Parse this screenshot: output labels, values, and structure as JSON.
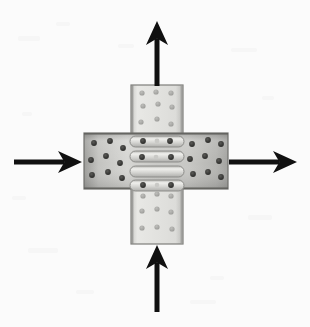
{
  "figure": {
    "title": "Bolted cruciform steel plate splice connection under biaxial loading",
    "background_color": "#fbfbfb",
    "width": 310,
    "height": 327
  },
  "members": {
    "horizontal_plate": {
      "name": "Horizontal splice plate",
      "x": 84,
      "y": 133,
      "width": 144,
      "height": 56,
      "fill_light": "#d8d8d6",
      "fill_mid": "#b9b9b6",
      "fill_dark": "#9d9d9a",
      "edge_color": "#6f6f6c"
    },
    "vertical_plate_top": {
      "name": "Upper vertical splice plate",
      "x": 131,
      "y": 85,
      "width": 52,
      "height": 52,
      "fill_light": "#e6e6e3",
      "fill_mid": "#d5d5d2",
      "edge_color": "#7a7a77"
    },
    "vertical_plate_bottom": {
      "name": "Lower vertical splice plate",
      "x": 131,
      "y": 186,
      "width": 52,
      "height": 58,
      "fill_light": "#e6e6e3",
      "fill_mid": "#d5d5d2",
      "edge_color": "#7a7a77"
    }
  },
  "weld_beads": {
    "name": "Weld bead strips at joint core",
    "count": 4,
    "color_light": "#ededea",
    "color_mid": "#cfcfcc",
    "outline": "#8d8d8a",
    "items": [
      {
        "x": 130,
        "y": 136,
        "width": 54,
        "height": 11,
        "rx": 5
      },
      {
        "x": 130,
        "y": 152,
        "width": 54,
        "height": 11,
        "rx": 5
      },
      {
        "x": 130,
        "y": 166,
        "width": 54,
        "height": 11,
        "rx": 5
      },
      {
        "x": 130,
        "y": 180,
        "width": 54,
        "height": 11,
        "rx": 5
      }
    ]
  },
  "bolt_holes": {
    "dark_color": "#3a3a38",
    "light_color": "#a9a9a6",
    "radius_dark": 2.9,
    "radius_light": 2.6,
    "horizontal_left": [
      {
        "cx": 94,
        "cy": 143
      },
      {
        "cx": 110,
        "cy": 141
      },
      {
        "cx": 123,
        "cy": 148
      },
      {
        "cx": 91,
        "cy": 160
      },
      {
        "cx": 106,
        "cy": 156
      },
      {
        "cx": 120,
        "cy": 163
      },
      {
        "cx": 92,
        "cy": 175
      },
      {
        "cx": 108,
        "cy": 172
      },
      {
        "cx": 122,
        "cy": 178
      }
    ],
    "horizontal_right": [
      {
        "cx": 192,
        "cy": 144
      },
      {
        "cx": 208,
        "cy": 140
      },
      {
        "cx": 221,
        "cy": 144
      },
      {
        "cx": 190,
        "cy": 159
      },
      {
        "cx": 205,
        "cy": 156
      },
      {
        "cx": 219,
        "cy": 161
      },
      {
        "cx": 193,
        "cy": 174
      },
      {
        "cx": 208,
        "cy": 172
      },
      {
        "cx": 221,
        "cy": 177
      }
    ],
    "weld_bolts": [
      {
        "cx": 143,
        "cy": 141
      },
      {
        "cx": 157,
        "cy": 141
      },
      {
        "cx": 170,
        "cy": 141
      },
      {
        "cx": 142,
        "cy": 158
      },
      {
        "cx": 156,
        "cy": 158
      },
      {
        "cx": 171,
        "cy": 158
      },
      {
        "cx": 143,
        "cy": 185
      },
      {
        "cx": 157,
        "cy": 184
      },
      {
        "cx": 171,
        "cy": 185
      }
    ],
    "vertical_top": [
      {
        "cx": 142,
        "cy": 93
      },
      {
        "cx": 156,
        "cy": 92
      },
      {
        "cx": 171,
        "cy": 93
      },
      {
        "cx": 143,
        "cy": 106
      },
      {
        "cx": 158,
        "cy": 104
      },
      {
        "cx": 172,
        "cy": 107
      },
      {
        "cx": 141,
        "cy": 122
      },
      {
        "cx": 157,
        "cy": 119
      },
      {
        "cx": 171,
        "cy": 124
      }
    ],
    "vertical_bottom": [
      {
        "cx": 143,
        "cy": 196
      },
      {
        "cx": 157,
        "cy": 194
      },
      {
        "cx": 171,
        "cy": 196
      },
      {
        "cx": 142,
        "cy": 211
      },
      {
        "cx": 157,
        "cy": 209
      },
      {
        "cx": 171,
        "cy": 212
      },
      {
        "cx": 142,
        "cy": 228
      },
      {
        "cx": 157,
        "cy": 227
      },
      {
        "cx": 172,
        "cy": 229
      }
    ]
  },
  "load_arrows": {
    "color": "#101010",
    "shaft_thickness": 5,
    "items": [
      {
        "id": "arrow-up",
        "label": "Upward tensile load arrow",
        "direction": "up",
        "tail_x": 157,
        "tail_y": 86,
        "tip_x": 157,
        "tip_y": 21,
        "head_half_width": 11,
        "head_length": 24
      },
      {
        "id": "arrow-down",
        "label": "Upward load arrow from below",
        "direction": "up",
        "tail_x": 157,
        "tail_y": 312,
        "tip_x": 157,
        "tip_y": 245,
        "head_half_width": 11,
        "head_length": 24
      },
      {
        "id": "arrow-left",
        "label": "Rightward load arrow from left",
        "direction": "right",
        "tail_x": 14,
        "tail_y": 162,
        "tip_x": 82,
        "tip_y": 162,
        "head_half_width": 11,
        "head_length": 24
      },
      {
        "id": "arrow-right",
        "label": "Rightward tensile load arrow",
        "direction": "right",
        "tail_x": 229,
        "tail_y": 162,
        "tip_x": 297,
        "tip_y": 162,
        "head_half_width": 11,
        "head_length": 24
      }
    ]
  }
}
